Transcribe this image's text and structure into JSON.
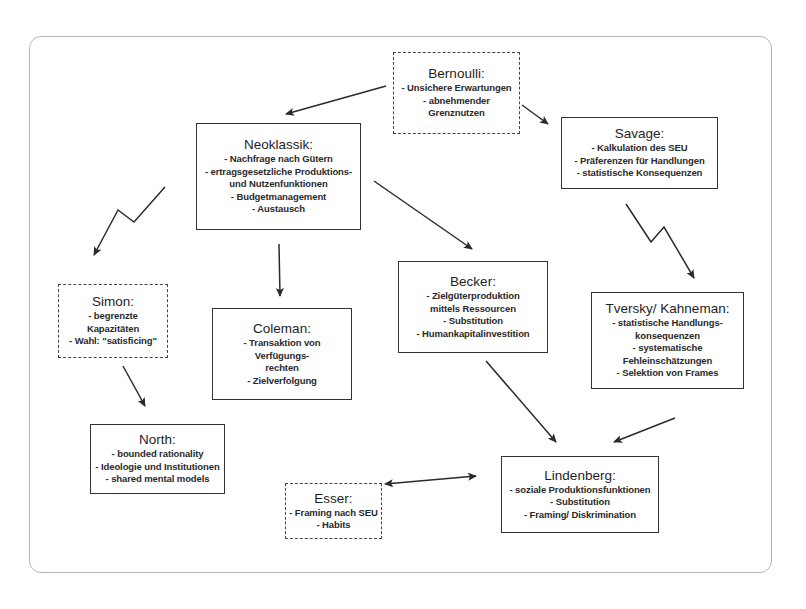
{
  "diagram": {
    "type": "concept-map",
    "nodes": {
      "bernoulli": {
        "title": "Bernoulli:",
        "border": "dashed",
        "lines": [
          "- Unsichere Erwartungen",
          "- abnehmender",
          "Grenznutzen"
        ]
      },
      "neoklassik": {
        "title": "Neoklassik:",
        "border": "solid",
        "lines": [
          "- Nachfrage nach Gütern",
          "- ertragsgesetzliche Produktions-",
          "und Nutzenfunktionen",
          "- Budgetmanagement",
          "- Austausch"
        ]
      },
      "savage": {
        "title": "Savage:",
        "border": "solid",
        "lines": [
          "- Kalkulation des SEU",
          "- Präferenzen für Handlungen",
          "- statistische Konsequenzen"
        ]
      },
      "simon": {
        "title": "Simon:",
        "border": "dashed",
        "lines": [
          "- begrenzte",
          "Kapazitäten",
          "- Wahl: \"satisficing\""
        ]
      },
      "coleman": {
        "title": "Coleman:",
        "border": "solid",
        "lines": [
          "- Transaktion von",
          "Verfügungs-",
          "rechten",
          "- Zielverfolgung"
        ]
      },
      "becker": {
        "title": "Becker:",
        "border": "solid",
        "lines": [
          "- Zielgüterproduktion",
          "mittels Ressourcen",
          "- Substitution",
          "- Humankapitalinvestition"
        ]
      },
      "tversky_kahneman": {
        "title": "Tversky/ Kahneman:",
        "border": "solid",
        "lines": [
          "- statistische Handlungs-",
          "konsequenzen",
          "- systematische",
          "Fehleinschätzungen",
          "- Selektion von Frames"
        ]
      },
      "north": {
        "title": "North:",
        "border": "solid",
        "lines": [
          "- bounded rationality",
          "- Ideologie und Institutionen",
          "- shared mental models"
        ]
      },
      "esser": {
        "title": "Esser:",
        "border": "dashed",
        "lines": [
          "- Framing nach SEU",
          "- Habits"
        ]
      },
      "lindenberg": {
        "title": "Lindenberg:",
        "border": "solid",
        "lines": [
          "- soziale Produktionsfunktionen",
          "- Substitution",
          "- Framing/ Diskrimination"
        ]
      }
    },
    "edges": [
      {
        "from": "Bernoulli",
        "to": "Neoklassik",
        "style": "straight"
      },
      {
        "from": "Bernoulli",
        "to": "Savage",
        "style": "straight"
      },
      {
        "from": "Neoklassik",
        "to": "Simon",
        "style": "zigzag"
      },
      {
        "from": "Neoklassik",
        "to": "Coleman",
        "style": "straight"
      },
      {
        "from": "Neoklassik",
        "to": "Becker",
        "style": "straight"
      },
      {
        "from": "Savage",
        "to": "Tversky/ Kahneman",
        "style": "zigzag"
      },
      {
        "from": "Simon",
        "to": "North",
        "style": "straight"
      },
      {
        "from": "Becker",
        "to": "Lindenberg",
        "style": "straight"
      },
      {
        "from": "Tversky/ Kahneman",
        "to": "Lindenberg",
        "style": "straight"
      },
      {
        "from": "Esser",
        "to": "Lindenberg",
        "style": "bidirectional"
      }
    ],
    "colors": {
      "line": "#2b2b2b",
      "frame": "#b5b5b5",
      "background": "#ffffff"
    }
  }
}
